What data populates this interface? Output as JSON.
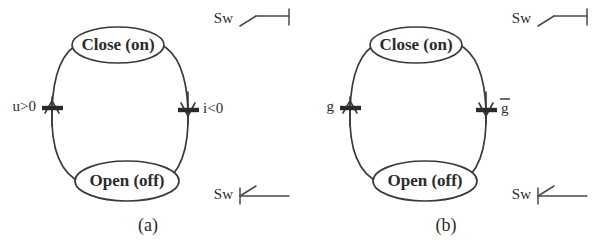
{
  "figure": {
    "background_color": "#ffffff",
    "ink_color": "#3a3a3a",
    "text_color": "#2b2b2b",
    "panels": [
      {
        "id": "a",
        "caption": "(a)",
        "states": {
          "top": "Close (on)",
          "bottom": "Open (off)"
        },
        "transitions": {
          "left_guard": "u>0",
          "right_guard": "i<0"
        },
        "switch_top": {
          "label": "Sw",
          "symbol": "switch-open"
        },
        "switch_bottom": {
          "label": "Sw",
          "symbol": "switch-closed"
        }
      },
      {
        "id": "b",
        "caption": "(b)",
        "states": {
          "top": "Close (on)",
          "bottom": "Open (off)"
        },
        "transitions": {
          "left_guard": "g",
          "right_guard": "g",
          "right_guard_overbar": true
        },
        "switch_top": {
          "label": "Sw",
          "symbol": "switch-open"
        },
        "switch_bottom": {
          "label": "Sw",
          "symbol": "switch-closed"
        }
      }
    ]
  }
}
